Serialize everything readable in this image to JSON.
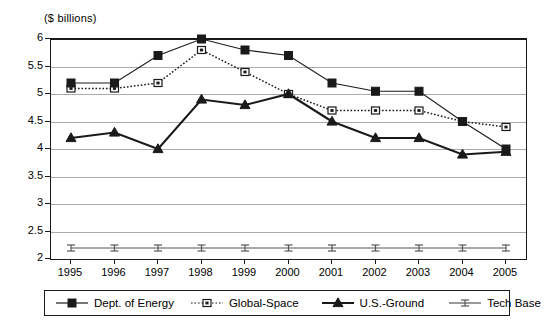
{
  "chart_data": {
    "type": "line",
    "title": "",
    "subtitle": "",
    "unit_caption": "($ billions)",
    "xlabel": "",
    "ylabel": "",
    "x": [
      1995,
      1996,
      1997,
      1998,
      1999,
      2000,
      2001,
      2002,
      2003,
      2004,
      2005
    ],
    "categories": [
      "1995",
      "1996",
      "1997",
      "1998",
      "1999",
      "2000",
      "2001",
      "2002",
      "2003",
      "2004",
      "2005"
    ],
    "ylim": [
      2,
      6
    ],
    "ytick_labels": [
      "2",
      "2.5",
      "3",
      "3.5",
      "4",
      "4.5",
      "5",
      "5.5",
      "6"
    ],
    "ytick_values": [
      2,
      2.5,
      3,
      3.5,
      4,
      4.5,
      5,
      5.5,
      6
    ],
    "grid": true,
    "grid_axis": "y",
    "legend_position": "bottom",
    "series": [
      {
        "name": "Dept. of Energy",
        "marker": "filled-square",
        "line_style": "solid",
        "color": "#1a1a1a",
        "values": [
          5.2,
          5.2,
          5.7,
          6.0,
          5.8,
          5.7,
          5.2,
          5.05,
          5.05,
          4.5,
          4.0
        ]
      },
      {
        "name": "Global-Space",
        "marker": "open-square",
        "line_style": "dotted",
        "color": "#1a1a1a",
        "values": [
          5.1,
          5.1,
          5.2,
          5.8,
          5.4,
          5.0,
          4.7,
          4.7,
          4.7,
          4.5,
          4.4
        ]
      },
      {
        "name": "U.S.-Ground",
        "marker": "filled-triangle",
        "line_style": "solid",
        "color": "#1a1a1a",
        "values": [
          4.2,
          4.3,
          4.0,
          4.9,
          4.8,
          5.0,
          4.5,
          4.2,
          4.2,
          3.9,
          3.95
        ]
      },
      {
        "name": "Tech Base",
        "marker": "ibeam",
        "line_style": "solid",
        "color": "#555555",
        "values": [
          2.2,
          2.2,
          2.2,
          2.2,
          2.2,
          2.2,
          2.2,
          2.2,
          2.2,
          2.2,
          2.2
        ]
      }
    ]
  },
  "legend": {
    "items": [
      {
        "label": "Dept. of Energy"
      },
      {
        "label": "Global-Space"
      },
      {
        "label": "U.S.-Ground"
      },
      {
        "label": "Tech Base"
      }
    ]
  }
}
